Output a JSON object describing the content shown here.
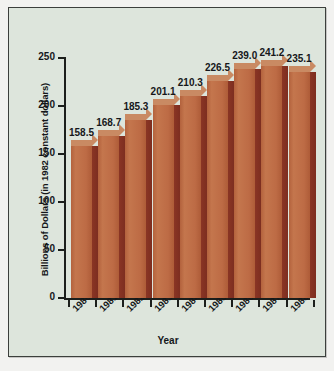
{
  "chart_data": {
    "type": "bar",
    "title": "",
    "xlabel": "Year",
    "ylabel": "Billions of Dollars (in 1982 constant dollars)",
    "categories": [
      "1980",
      "1981",
      "1982",
      "1983",
      "1984",
      "1985",
      "1986",
      "1987",
      "1988"
    ],
    "values": [
      158.5,
      168.7,
      185.3,
      201.1,
      210.3,
      226.5,
      239.0,
      241.2,
      235.1
    ],
    "value_labels": [
      "158.5",
      "168.7",
      "185.3",
      "201.1",
      "210.3",
      "226.5",
      "239.0",
      "241.2",
      "235.1"
    ],
    "yticks": [
      0,
      50,
      100,
      150,
      200,
      250
    ],
    "ytick_labels": [
      "0",
      "50",
      "100",
      "150",
      "200",
      "250"
    ],
    "ylim": [
      0,
      250
    ],
    "grid": false,
    "legend": null,
    "style": "3d-bar",
    "colors": {
      "bar_front": "#bd6b45",
      "bar_side": "#82301f",
      "bar_top": "#c98a63",
      "background": "#dde5dc",
      "axis": "#1c1f1c",
      "text": "#15171a",
      "frame_border": "#3c3f3c",
      "page": "#f2f2f0"
    }
  }
}
